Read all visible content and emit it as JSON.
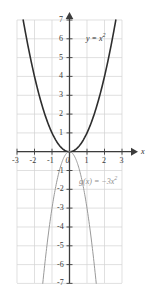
{
  "chart_data": {
    "type": "line",
    "title": "",
    "subtitle": "",
    "xlabel": "x",
    "ylabel": "",
    "xlim": [
      -3,
      3
    ],
    "ylim": [
      -7,
      7
    ],
    "grid": true,
    "grid_step_x": 1,
    "grid_step_y": 1,
    "legend_position": "inline-annotation",
    "x_ticks": [
      -3,
      -2,
      -1,
      0,
      1,
      2,
      3
    ],
    "x_tick_labels": [
      "-3",
      "-2",
      "-1",
      "0",
      "1",
      "2",
      "3"
    ],
    "y_ticks": [
      -7,
      -6,
      -5,
      -4,
      -3,
      -2,
      -1,
      1,
      2,
      3,
      4,
      5,
      6,
      7
    ],
    "y_tick_labels": [
      "-7",
      "-6",
      "-5",
      "-4",
      "-3",
      "-2",
      "-1",
      "1",
      "2",
      "3",
      "4",
      "5",
      "6",
      "7"
    ],
    "origin_label": "0",
    "series": [
      {
        "name": "y = x^2",
        "label_text": "y = x",
        "label_exponent": "2",
        "equation": "y = x²",
        "color": "#2e2e2e",
        "linewidth": 1.6,
        "coefficient": 1,
        "x": [
          -2.65,
          -2.4,
          -2.0,
          -1.6,
          -1.2,
          -0.8,
          -0.4,
          0,
          0.4,
          0.8,
          1.2,
          1.6,
          2.0,
          2.4,
          2.65
        ],
        "y": [
          7.02,
          5.76,
          4.0,
          2.56,
          1.44,
          0.64,
          0.16,
          0,
          0.16,
          0.64,
          1.44,
          2.56,
          4.0,
          5.76,
          7.02
        ]
      },
      {
        "name": "g(x) = -3x^2",
        "label_text": "g(x) = −3x",
        "label_exponent": "2",
        "equation": "g(x) = −3x²",
        "color": "#9a9a9a",
        "linewidth": 1.0,
        "coefficient": -3,
        "x": [
          -1.53,
          -1.3,
          -1.1,
          -0.9,
          -0.7,
          -0.5,
          -0.3,
          0,
          0.3,
          0.5,
          0.7,
          0.9,
          1.1,
          1.3,
          1.53
        ],
        "y": [
          -7.02,
          -5.07,
          -3.63,
          -2.43,
          -1.47,
          -0.75,
          -0.27,
          0,
          -0.27,
          -0.75,
          -1.47,
          -2.43,
          -3.63,
          -5.07,
          -7.02
        ]
      }
    ],
    "annotations": [
      {
        "name": "f-label",
        "text": "y = x²",
        "x": 1.25,
        "y": 6.3
      },
      {
        "name": "g-label",
        "text": "g(x) = −3x²",
        "x": 0.75,
        "y": -2.0
      }
    ],
    "colors": {
      "background": "#ffffff",
      "grid": "#d3d3d3",
      "axis": "#3c3c3c",
      "curve_primary": "#2e2e2e",
      "curve_secondary": "#9a9a9a",
      "tick_text": "#3a3a3a"
    }
  },
  "axes": {
    "x_axis_name": "x",
    "y_axis_name": ""
  }
}
